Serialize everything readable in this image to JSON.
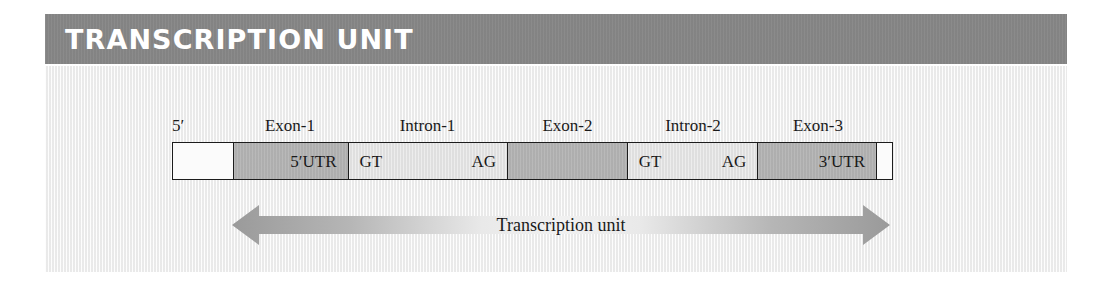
{
  "header": {
    "title": "TRANSCRIPTION UNIT",
    "bar_color": "#868686",
    "text_color": "#ffffff"
  },
  "panel": {
    "background_color": "#f4f4f4"
  },
  "diagram": {
    "five_prime_label": "5′",
    "top_labels": [
      {
        "name": "exon-1-label",
        "text": "Exon-1"
      },
      {
        "name": "intron-1-label",
        "text": "Intron-1"
      },
      {
        "name": "exon-2-label",
        "text": "Exon-2"
      },
      {
        "name": "intron-2-label",
        "text": "Intron-2"
      },
      {
        "name": "exon-3-label",
        "text": "Exon-3"
      }
    ],
    "segments": [
      {
        "name": "five-prime-flank",
        "kind": "flank",
        "label_left": "",
        "label_right": ""
      },
      {
        "name": "exon-1-segment",
        "kind": "exon",
        "label_left": "",
        "label_right": "5′UTR"
      },
      {
        "name": "intron-1-segment",
        "kind": "intron",
        "label_left": "GT",
        "label_right": "AG"
      },
      {
        "name": "exon-2-segment",
        "kind": "exon",
        "label_left": "",
        "label_right": ""
      },
      {
        "name": "intron-2-segment",
        "kind": "intron",
        "label_left": "GT",
        "label_right": "AG"
      },
      {
        "name": "exon-3-segment",
        "kind": "exon",
        "label_left": "",
        "label_right": "3′UTR"
      },
      {
        "name": "three-prime-flank",
        "kind": "flank",
        "label_left": "",
        "label_right": ""
      }
    ],
    "exon_color": "#b4b4b4",
    "intron_color": "#e3e3e3",
    "outline_color": "#1c1c1c",
    "arrow": {
      "label": "Transcription unit",
      "tip_color": "#9a9a9a",
      "mid_color": "#e6e6e6"
    }
  }
}
